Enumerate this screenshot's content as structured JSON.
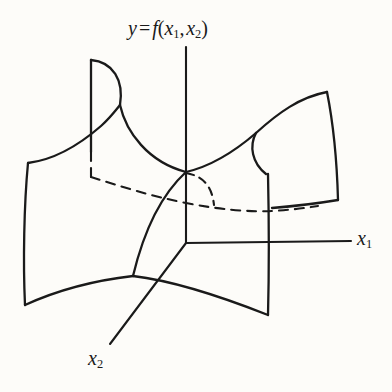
{
  "figure": {
    "type": "3d-surface-sketch",
    "background_color": "#fdfcf9",
    "stroke_color": "#1a1a1a",
    "width": 392,
    "height": 392,
    "labels": {
      "vertical_axis": {
        "text_full": "y = f(x1, x2)",
        "lead_variable": "y",
        "equals": "=",
        "function_name": "f",
        "open_paren": "(",
        "arg1_base": "x",
        "arg1_sub": "1",
        "comma": ",",
        "arg2_base": "x",
        "arg2_sub": "2",
        "close_paren": ")"
      },
      "horizontal_axis": {
        "text_full": "x1",
        "base": "x",
        "sub": "1"
      },
      "depth_axis": {
        "text_full": "x2",
        "base": "x",
        "sub": "2"
      }
    },
    "axes": {
      "origin": [
        186,
        243
      ],
      "y_axis": {
        "name": "y-axis",
        "from": [
          186,
          47
        ],
        "to": [
          186,
          243
        ],
        "style": "solid"
      },
      "x1_axis": {
        "name": "x1-axis",
        "from": [
          186,
          243
        ],
        "to": [
          351,
          241
        ],
        "style": "solid"
      },
      "x2_axis": {
        "name": "x2-axis",
        "from": [
          186,
          243
        ],
        "to": [
          110,
          344
        ],
        "style": "solid"
      }
    },
    "surface": {
      "saddle_point": [
        186,
        172
      ],
      "hidden_edges_style": "dashed",
      "visible_edges_style": "solid"
    }
  }
}
